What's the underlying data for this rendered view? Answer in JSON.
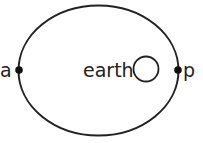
{
  "diagram": {
    "labels": {
      "apogee": "a",
      "perigee": "p",
      "earth": "earth"
    },
    "colors": {
      "stroke": "#222222",
      "background": "#ffffff"
    }
  }
}
